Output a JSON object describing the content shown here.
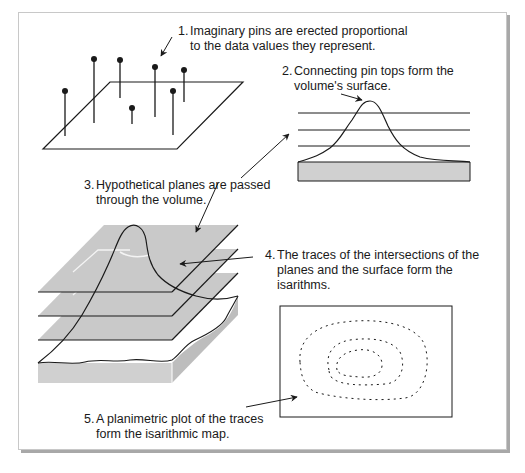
{
  "diagram": {
    "steps": [
      {
        "number": "1.",
        "line1": "Imaginary pins are erected proportional",
        "line2": "to the data values they represent.",
        "line3": ""
      },
      {
        "number": "2.",
        "line1": "Connecting pin tops form the",
        "line2": "volume's surface.",
        "line3": ""
      },
      {
        "number": "3.",
        "line1": "Hypothetical planes are passed",
        "line2": "through the volume.",
        "line3": ""
      },
      {
        "number": "4.",
        "line1": "The traces of the intersections of the",
        "line2": "planes and the surface form the",
        "line3": "isarithms."
      },
      {
        "number": "5.",
        "line1": "A planimetric plot of the traces",
        "line2": "form the isarithmic map.",
        "line3": ""
      }
    ],
    "colors": {
      "plane_fill": "#c9c9c9",
      "block_fill": "#d0d0d0",
      "line": "#1a1a1a",
      "frame_shadow": "#a8a8a8",
      "isarithm_highlight": "#f4f4f4"
    },
    "pins": [
      {
        "x": 65,
        "top": 91,
        "base": 136
      },
      {
        "x": 94,
        "top": 59,
        "base": 123
      },
      {
        "x": 120,
        "top": 60,
        "base": 98
      },
      {
        "x": 132,
        "top": 108,
        "base": 124
      },
      {
        "x": 155,
        "top": 67,
        "base": 117
      },
      {
        "x": 173,
        "top": 91,
        "base": 135
      },
      {
        "x": 184,
        "top": 70,
        "base": 102
      }
    ]
  }
}
